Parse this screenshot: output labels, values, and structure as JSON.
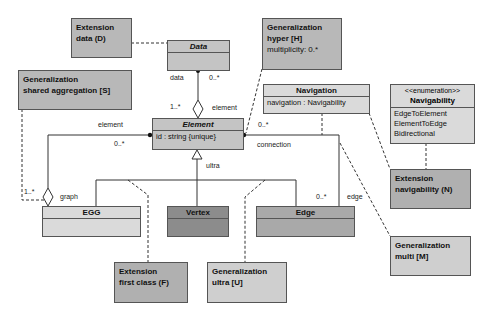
{
  "colors": {
    "note_fill": "#b8b8b8",
    "note_light_fill": "#cfcfcf",
    "class_mid": "#c4c4c4",
    "class_light": "#dadada",
    "vertex_fill": "#8c8c8c",
    "edge_fill": "#a9a9a9",
    "line": "#333333"
  },
  "classes": {
    "data": {
      "name": "Data"
    },
    "element": {
      "name": "Element",
      "attribute": "id : string {unique}"
    },
    "egg": {
      "name": "EGG"
    },
    "vertex": {
      "name": "Vertex"
    },
    "edge": {
      "name": "Edge"
    },
    "navigation": {
      "name": "Navigation",
      "attribute": "navigation : Navigability"
    },
    "navigability": {
      "stereotype": "<<enumeration>>",
      "name": "Navigability",
      "literals": [
        "EdgeToElement",
        "ElementToEdge",
        "Bidirectional"
      ]
    }
  },
  "notes": {
    "ext_data": {
      "line1": "Extension",
      "line2": "data (D)"
    },
    "gen_shared": {
      "line1": "Generalization",
      "line2": "shared aggregation [S]"
    },
    "gen_hyper": {
      "line1": "Generalization",
      "line2": "hyper [H]",
      "line3": "multiplicity: 0.*"
    },
    "ext_nav": {
      "line1": "Extension",
      "line2": "navigability (N)"
    },
    "gen_multi": {
      "line1": "Generalization",
      "line2": "multi [M]"
    },
    "ext_first": {
      "line1": "Extension",
      "line2": "first class (F)"
    },
    "gen_ultra": {
      "line1": "Generalization",
      "line2": "ultra [U]"
    }
  },
  "labels": {
    "data_role": "data",
    "data_mult": "0..*",
    "element_mult_top": "1..*",
    "element_role_top": "element",
    "element_role_left": "element",
    "element_mult_left": "0..*",
    "egg_mult": "1..*",
    "graph_role": "graph",
    "ultra": "ultra",
    "conn_mult": "0..*",
    "connection_role": "connection",
    "edge_mult": "0..*",
    "edge_role": "edge"
  }
}
